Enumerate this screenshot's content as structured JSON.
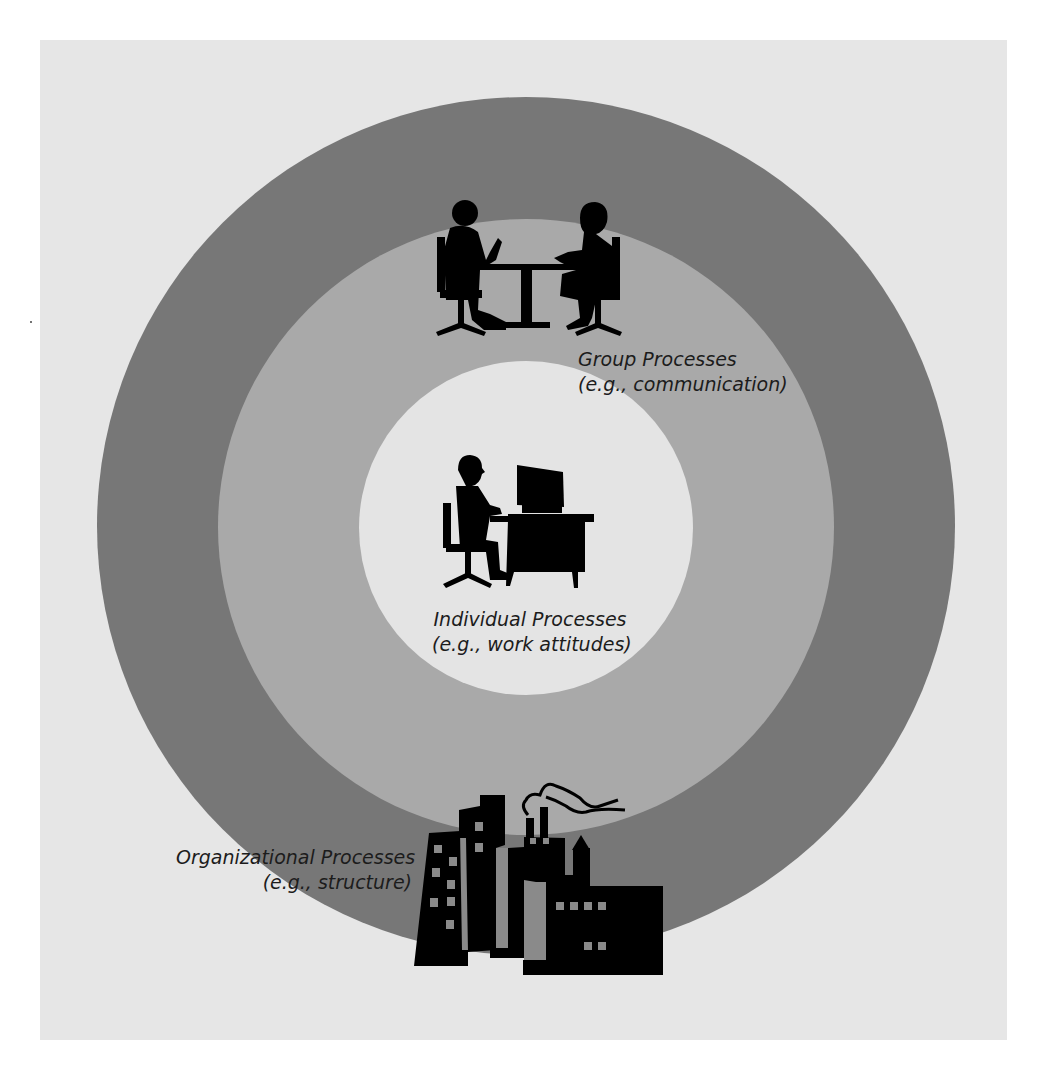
{
  "diagram": {
    "type": "concentric-circles",
    "colors": {
      "page_background": "#ffffff",
      "panel_background": "#e6e6e6",
      "outer_ring": "#777777",
      "middle_ring": "#a9a9a9",
      "inner_circle": "#e4e4e4",
      "icon_fill": "#000000"
    },
    "layers": [
      {
        "id": "organizational",
        "title": "Organizational Processes",
        "example": "(e.g., structure)",
        "icon": "factory-buildings-icon"
      },
      {
        "id": "group",
        "title": "Group Processes",
        "example": "(e.g., communication)",
        "icon": "two-people-at-table-icon"
      },
      {
        "id": "individual",
        "title": "Individual Processes",
        "example": "(e.g., work attitudes)",
        "icon": "person-at-computer-icon"
      }
    ]
  }
}
